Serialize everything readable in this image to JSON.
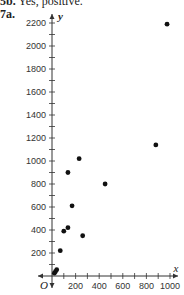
{
  "header": {
    "prev_label": "5b.",
    "prev_text": "Yes, positive.",
    "label": "7a."
  },
  "chart_data": {
    "type": "scatter",
    "title": "",
    "xlabel": "x",
    "ylabel": "y",
    "origin_label": "O",
    "xlim": [
      0,
      1000
    ],
    "ylim": [
      0,
      2200
    ],
    "x_ticks": [
      200,
      400,
      600,
      800,
      1000
    ],
    "y_ticks": [
      200,
      400,
      600,
      800,
      1000,
      1200,
      1400,
      1600,
      1800,
      2000,
      2200
    ],
    "grid": false,
    "points": [
      {
        "x": 975,
        "y": 2190
      },
      {
        "x": 880,
        "y": 1140
      },
      {
        "x": 230,
        "y": 1020
      },
      {
        "x": 135,
        "y": 900
      },
      {
        "x": 450,
        "y": 800
      },
      {
        "x": 170,
        "y": 610
      },
      {
        "x": 135,
        "y": 420
      },
      {
        "x": 100,
        "y": 390
      },
      {
        "x": 260,
        "y": 350
      },
      {
        "x": 70,
        "y": 220
      },
      {
        "x": 40,
        "y": 55
      },
      {
        "x": 30,
        "y": 40
      },
      {
        "x": 20,
        "y": 25
      }
    ]
  }
}
